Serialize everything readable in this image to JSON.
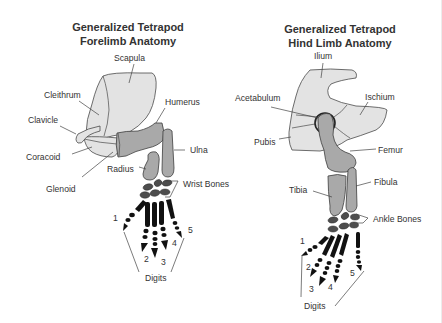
{
  "colors": {
    "background": "#ffffff",
    "text": "#333333",
    "girdle_fill": "#e3e3e3",
    "long_bone_fill": "#a9a9a9",
    "carpal_fill": "#4d4d4d",
    "phalanx_fill": "#111111",
    "right_edge": "#ececec"
  },
  "forelimb": {
    "title_line1": "Generalized Tetrapod",
    "title_line2": "Forelimb Anatomy",
    "labels": {
      "scapula": "Scapula",
      "cleithrum": "Cleithrum",
      "clavicle": "Clavicle",
      "coracoid": "Coracoid",
      "glenoid": "Glenoid",
      "humerus": "Humerus",
      "ulna": "Ulna",
      "radius": "Radius",
      "wrist_bones": "Wrist Bones",
      "digits": "Digits"
    },
    "digit_numbers": [
      "1",
      "2",
      "3",
      "4",
      "5"
    ]
  },
  "hindlimb": {
    "title_line1": "Generalized Tetrapod",
    "title_line2": "Hind Limb Anatomy",
    "labels": {
      "ilium": "Ilium",
      "acetabulum": "Acetabulum",
      "ischium": "Ischium",
      "pubis": "Pubis",
      "femur": "Femur",
      "tibia": "Tibia",
      "fibula": "Fibula",
      "ankle_bones": "Ankle Bones",
      "digits": "Digits"
    },
    "digit_numbers": [
      "1",
      "2",
      "3",
      "4",
      "5"
    ]
  }
}
